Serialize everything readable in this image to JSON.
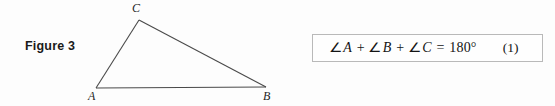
{
  "page": {
    "background_color": "#fdfdfd",
    "width": 555,
    "height": 106
  },
  "figure": {
    "caption": "Figure 3",
    "diagram_type": "triangle",
    "line_color": "#4a4a4a",
    "vertices": [
      {
        "name": "C",
        "label": "C",
        "x": 139,
        "y": 20
      },
      {
        "name": "A",
        "label": "A",
        "x": 96,
        "y": 88
      },
      {
        "name": "B",
        "label": "B",
        "x": 266,
        "y": 87
      }
    ],
    "edges": [
      {
        "name": "edge-ac",
        "from": "A",
        "to": "C"
      },
      {
        "name": "edge-cb",
        "from": "C",
        "to": "B"
      },
      {
        "name": "edge-ab",
        "from": "A",
        "to": "B"
      }
    ]
  },
  "equation": {
    "border_color": "#b9b9b9",
    "background_color": "#fefefe",
    "angle_symbol": "∠",
    "term_1_var": "A",
    "operator_1": "+",
    "term_2_var": "B",
    "operator_2": "+",
    "term_3_var": "C",
    "equals": "=",
    "value": "180°",
    "number": "(1)",
    "plain_text": "∠A + ∠B + ∠C = 180°"
  }
}
